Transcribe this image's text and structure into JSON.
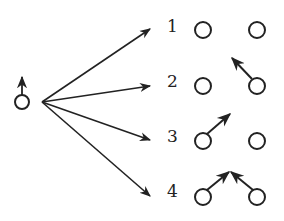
{
  "diagram": {
    "type": "spin-configuration-branching",
    "source": {
      "name": "initial-particle",
      "spin": "up"
    },
    "branches": [
      {
        "label": "1",
        "left_spin": "none",
        "right_spin": "none"
      },
      {
        "label": "2",
        "left_spin": "none",
        "right_spin": "up-left"
      },
      {
        "label": "3",
        "left_spin": "up-right",
        "right_spin": "none"
      },
      {
        "label": "4",
        "left_spin": "up-right",
        "right_spin": "up-left"
      }
    ],
    "colors": {
      "stroke": "#222222",
      "background": "#ffffff"
    }
  }
}
